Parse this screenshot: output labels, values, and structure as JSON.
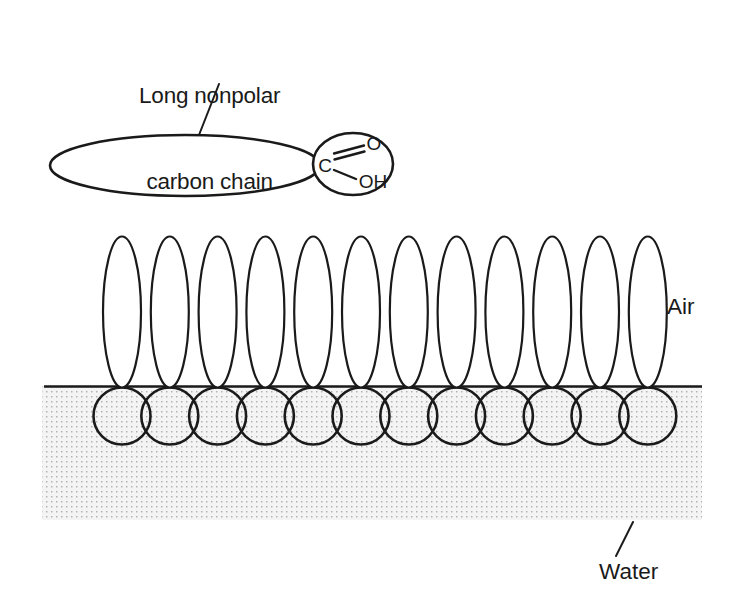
{
  "figure": {
    "background_color": "#ffffff",
    "ink_color": "#1a1a1a",
    "water_fill_color": "#f2f2f2",
    "stipple_dot_color": "#b4b4b4"
  },
  "labels": {
    "chain_line1": "Long nonpolar",
    "chain_line2": "carbon chain",
    "air": "Air",
    "water": "Water"
  },
  "molecule_detail": {
    "tail_shape": "ellipse",
    "head_shape": "circle",
    "atoms": {
      "carbon": "C",
      "carbonyl_oxygen": "O",
      "hydroxyl": "OH"
    },
    "bonds": {
      "carbonyl": "double",
      "hydroxyl": "single"
    }
  },
  "monolayer": {
    "molecule_count": 12,
    "tail_label": "nonpolar tail",
    "head_label": "polar carboxyl head",
    "first_tail_center_x": 122,
    "tail_spacing_x": 47.8,
    "tail_rx": 19,
    "tail_ry": 75.5,
    "tail_center_y": 312,
    "head_r": 28.5,
    "head_center_y": 416,
    "waterline_y": 386
  },
  "water_region": {
    "left": 42,
    "right": 702,
    "top": 386,
    "bottom": 520
  },
  "leader_lines": {
    "chain": {
      "x1": 219,
      "y1": 84,
      "x2": 199,
      "y2": 135
    },
    "water": {
      "x1": 633,
      "y1": 522,
      "x2": 616,
      "y2": 556
    }
  }
}
